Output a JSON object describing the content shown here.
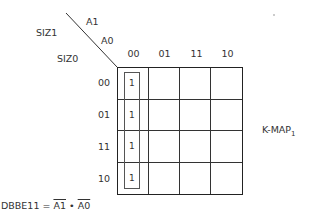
{
  "axes": {
    "var_top_a1": "A1",
    "var_top_a0": "A0",
    "var_left_siz1": "SIZ1",
    "var_left_siz0": "SIZ0"
  },
  "columns": [
    "00",
    "01",
    "11",
    "10"
  ],
  "rows": [
    "00",
    "01",
    "11",
    "10"
  ],
  "cells": [
    [
      "1",
      "",
      "",
      ""
    ],
    [
      "1",
      "",
      "",
      ""
    ],
    [
      "1",
      "",
      "",
      ""
    ],
    [
      "1",
      "",
      "",
      ""
    ]
  ],
  "map_label": {
    "name": "K-MAP",
    "subscript": "1"
  },
  "equation": {
    "lhs": "DBBE11 =",
    "term1": "A1",
    "op": "•",
    "term2": "A0"
  },
  "grouping": {
    "column": "00",
    "rows": [
      "00",
      "01",
      "11",
      "10"
    ]
  }
}
